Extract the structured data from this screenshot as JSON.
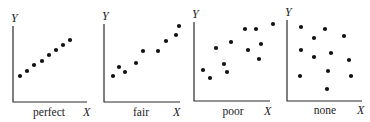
{
  "chart_data": [
    {
      "type": "scatter",
      "title": "perfect",
      "xlabel": "X",
      "ylabel": "Y",
      "grid": false,
      "frame": {
        "y_axis_x": 13,
        "axis_top": 26,
        "x_axis_y": 102,
        "x_axis_end": 87
      },
      "caption_pos": {
        "x": 49,
        "y": 116
      },
      "xlabel_pos": {
        "x": 83,
        "y": 116
      },
      "ylabel_pos": {
        "x": 11,
        "y": 22
      },
      "points": [
        [
          20,
          76
        ],
        [
          27,
          71
        ],
        [
          34,
          65
        ],
        [
          42,
          61
        ],
        [
          49,
          55
        ],
        [
          56,
          50
        ],
        [
          63,
          45
        ],
        [
          70,
          40
        ]
      ]
    },
    {
      "type": "scatter",
      "title": "fair",
      "xlabel": "X",
      "ylabel": "Y",
      "grid": false,
      "frame": {
        "y_axis_x": 104,
        "axis_top": 24,
        "x_axis_y": 102,
        "x_axis_end": 180
      },
      "caption_pos": {
        "x": 141,
        "y": 116
      },
      "xlabel_pos": {
        "x": 173,
        "y": 116
      },
      "ylabel_pos": {
        "x": 102,
        "y": 20
      },
      "points": [
        [
          113,
          76
        ],
        [
          119,
          67
        ],
        [
          125,
          72
        ],
        [
          136,
          63
        ],
        [
          143,
          51
        ],
        [
          158,
          51
        ],
        [
          166,
          41
        ],
        [
          176,
          35
        ],
        [
          179,
          26
        ]
      ]
    },
    {
      "type": "scatter",
      "title": "poor",
      "xlabel": "X",
      "ylabel": "Y",
      "grid": false,
      "frame": {
        "y_axis_x": 194,
        "axis_top": 22,
        "x_axis_y": 101,
        "x_axis_end": 270
      },
      "caption_pos": {
        "x": 233,
        "y": 115
      },
      "xlabel_pos": {
        "x": 264,
        "y": 115
      },
      "ylabel_pos": {
        "x": 192,
        "y": 18
      },
      "points": [
        [
          203,
          70
        ],
        [
          210,
          78
        ],
        [
          216,
          48
        ],
        [
          224,
          64
        ],
        [
          227,
          72
        ],
        [
          231,
          42
        ],
        [
          245,
          29
        ],
        [
          248,
          50
        ],
        [
          256,
          29
        ],
        [
          259,
          59
        ],
        [
          261,
          44
        ],
        [
          273,
          24
        ]
      ]
    },
    {
      "type": "scatter",
      "title": "none",
      "xlabel": "X",
      "ylabel": "Y",
      "grid": false,
      "frame": {
        "y_axis_x": 287,
        "axis_top": 20,
        "x_axis_y": 101,
        "x_axis_end": 362
      },
      "caption_pos": {
        "x": 325,
        "y": 114
      },
      "xlabel_pos": {
        "x": 357,
        "y": 114
      },
      "ylabel_pos": {
        "x": 285,
        "y": 16
      },
      "points": [
        [
          301,
          27
        ],
        [
          314,
          38
        ],
        [
          325,
          29
        ],
        [
          344,
          36
        ],
        [
          301,
          50
        ],
        [
          314,
          57
        ],
        [
          331,
          53
        ],
        [
          349,
          60
        ],
        [
          300,
          76
        ],
        [
          328,
          71
        ],
        [
          351,
          76
        ],
        [
          327,
          89
        ]
      ]
    }
  ],
  "style": {
    "dot_color": "#111111",
    "axis_color": "#2a2a2a",
    "dot_radius": 2.1
  }
}
